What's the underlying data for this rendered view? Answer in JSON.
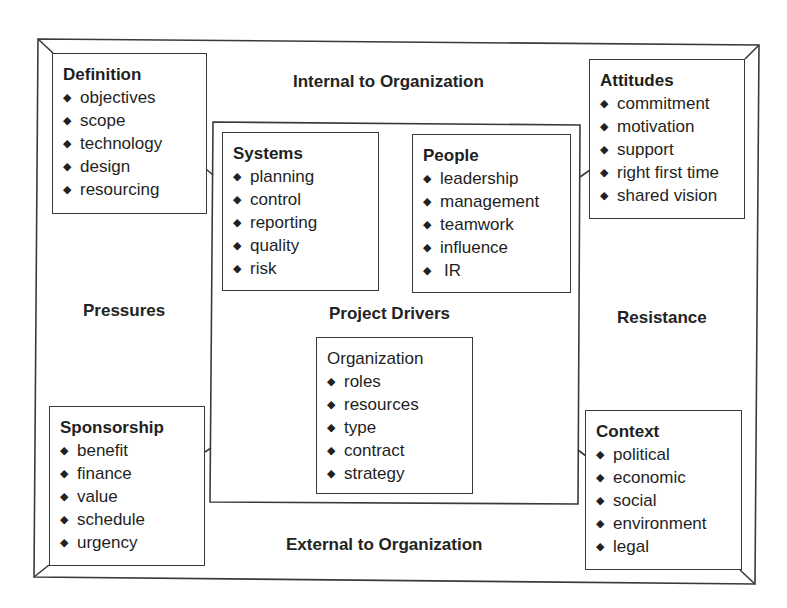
{
  "diagram": {
    "labels": {
      "top": "Internal to Organization",
      "bottom": "External to Organization",
      "left": "Pressures",
      "right": "Resistance",
      "center": "Project Drivers"
    },
    "bullet_glyph": "◆",
    "boxes": {
      "definition": {
        "title": "Definition",
        "items": [
          "objectives",
          "scope",
          "technology",
          "design",
          "resourcing"
        ]
      },
      "attitudes": {
        "title": "Attitudes",
        "items": [
          "commitment",
          "motivation",
          "support",
          "right first time",
          "shared vision"
        ]
      },
      "sponsorship": {
        "title": "Sponsorship",
        "items": [
          "benefit",
          "finance",
          "value",
          "schedule",
          "urgency"
        ]
      },
      "context": {
        "title": "Context",
        "items": [
          "political",
          "economic",
          "social",
          "environment",
          "legal"
        ]
      },
      "systems": {
        "title": "Systems",
        "items": [
          "planning",
          "control",
          "reporting",
          "quality",
          "risk"
        ]
      },
      "people": {
        "title": "People",
        "items": [
          "leadership",
          "management",
          "teamwork",
          "influence",
          "IR"
        ]
      },
      "organization": {
        "title": "Organization",
        "items": [
          "roles",
          "resources",
          "type",
          "contract",
          "strategy"
        ]
      }
    }
  }
}
